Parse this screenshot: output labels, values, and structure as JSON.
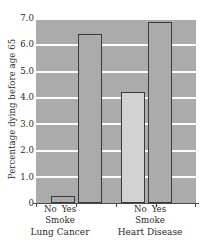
{
  "chart_data": {
    "type": "bar",
    "title": "",
    "subtitle": "",
    "xlabel": "Smoke",
    "ylabel": "Percentage dying before age 65",
    "ylim": [
      0,
      7.0
    ],
    "ytick_labels": [
      "7.0",
      "6.0",
      "5.0",
      "4.0",
      "3.0",
      "2.0",
      "1.0",
      "0"
    ],
    "ytick_values": [
      7.0,
      6.0,
      5.0,
      4.0,
      3.0,
      2.0,
      1.0,
      0
    ],
    "grid": "horizontal",
    "legend": "none",
    "categories": [
      "Lung Cancer / No",
      "Lung Cancer / Yes",
      "Heart Disease / No",
      "Heart Disease / Yes"
    ],
    "values": [
      0.25,
      6.4,
      4.2,
      6.85
    ],
    "groups": [
      {
        "name": "Lung Cancer",
        "factor_label": "Smoke",
        "levels": [
          "No",
          "Yes"
        ],
        "values": [
          0.25,
          6.4
        ],
        "fills": [
          "#ababab",
          "#ababab"
        ]
      },
      {
        "name": "Heart Disease",
        "factor_label": "Smoke",
        "levels": [
          "No",
          "Yes"
        ],
        "values": [
          4.2,
          6.85
        ],
        "fills": [
          "#d2d2d2",
          "#ababab"
        ]
      }
    ],
    "colors": {
      "plot_background": "#ababab",
      "gridline": "#fdfdfd",
      "bar_outline": "#3a3a3a",
      "bar_fill_dark": "#ababab",
      "bar_fill_light": "#d2d2d2",
      "axis": "#4a4a4a",
      "text": "#2b2b2b",
      "page_background": "#ffffff"
    }
  }
}
